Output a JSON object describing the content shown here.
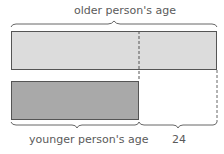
{
  "diagram": {
    "type": "tape-diagram",
    "top_label": "older person's age",
    "bottom_left_label": "younger person's age",
    "bottom_right_label": "24",
    "colors": {
      "older_bar": "#dcdcdc",
      "younger_bar": "#a9a9a9",
      "stroke": "#555555"
    }
  }
}
